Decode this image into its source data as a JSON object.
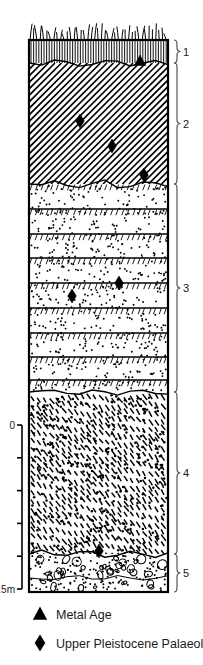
{
  "figure": {
    "type": "stratigraphic-section",
    "title": "",
    "width": 203,
    "height": 665
  },
  "column": {
    "left": 29,
    "right": 168,
    "top": 40,
    "bottom": 592,
    "outline_color": "#000000"
  },
  "scale_bar": {
    "label_top": "0",
    "label_bottom": "0.5m",
    "x": 22,
    "y_top": 425,
    "y_bottom": 589,
    "ticks": 5,
    "units": "m"
  },
  "units": [
    {
      "id": "unit-1",
      "number": "1",
      "pattern": "vertical-lines",
      "top": 40,
      "bottom": 63,
      "brace_label": "1",
      "description": "topsoil with surface vegetation"
    },
    {
      "id": "unit-2",
      "number": "2",
      "pattern": "diagonal-hatch",
      "top": 63,
      "bottom": 184,
      "brace_label": "2",
      "description": "diagonally hatched deposit"
    },
    {
      "id": "unit-3",
      "number": "3",
      "pattern": "banded-dots-ticks",
      "top": 184,
      "bottom": 392,
      "brace_label": "3",
      "description": "laminated silty sand with bedding planes"
    },
    {
      "id": "unit-4",
      "number": "4",
      "pattern": "dashes-dots",
      "top": 392,
      "bottom": 554,
      "brace_label": "4",
      "description": "sandy deposit with dispersed dashes"
    },
    {
      "id": "unit-5",
      "number": "5",
      "pattern": "clasts-dots",
      "top": 554,
      "bottom": 592,
      "brace_label": "5",
      "description": "gravel with rounded clasts"
    }
  ],
  "markers": [
    {
      "symbol": "triangle",
      "series": "metal-age",
      "x": 140,
      "y": 61
    },
    {
      "symbol": "diamond",
      "series": "palaeolithic",
      "x": 80,
      "y": 121
    },
    {
      "symbol": "diamond",
      "series": "palaeolithic",
      "x": 112,
      "y": 146
    },
    {
      "symbol": "diamond",
      "series": "palaeolithic",
      "x": 144,
      "y": 175
    },
    {
      "symbol": "diamond",
      "series": "palaeolithic",
      "x": 72,
      "y": 296
    },
    {
      "symbol": "diamond",
      "series": "palaeolithic",
      "x": 119,
      "y": 283
    },
    {
      "symbol": "diamond",
      "series": "palaeolithic",
      "x": 99,
      "y": 551
    }
  ],
  "legend": {
    "items": [
      {
        "symbol": "triangle",
        "label": "Metal Age"
      },
      {
        "symbol": "diamond",
        "label": "Upper Pleistocene Palaeolithic"
      }
    ]
  },
  "colors": {
    "ink": "#000000",
    "paper": "#ffffff",
    "brace": "#555555",
    "text": "#1a1a1a"
  }
}
